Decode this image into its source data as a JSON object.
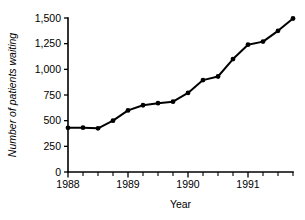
{
  "chart_data": {
    "type": "line",
    "title": "",
    "xlabel": "Year",
    "ylabel": "Number of patients waiting",
    "xlim": [
      1988.0,
      1991.75
    ],
    "ylim": [
      0,
      1500
    ],
    "grid": false,
    "legend": null,
    "marker": "filled-circle",
    "line_color": "#000000",
    "x": [
      1988.0,
      1988.25,
      1988.5,
      1988.75,
      1989.0,
      1989.25,
      1989.5,
      1989.75,
      1990.0,
      1990.25,
      1990.5,
      1990.75,
      1991.0,
      1991.25,
      1991.5,
      1991.75
    ],
    "values": [
      430,
      432,
      425,
      500,
      600,
      650,
      670,
      685,
      770,
      895,
      930,
      1100,
      1240,
      1270,
      1375,
      1495
    ],
    "x_tick_labels": [
      "1988",
      "1989",
      "1990",
      "1991"
    ],
    "x_tick_values": [
      1988,
      1989,
      1990,
      1991
    ],
    "x_minor_tick_values": [
      1988.0,
      1988.25,
      1988.5,
      1988.75,
      1989.0,
      1989.25,
      1989.5,
      1989.75,
      1990.0,
      1990.25,
      1990.5,
      1990.75,
      1991.0,
      1991.25,
      1991.5,
      1991.75
    ],
    "y_tick_labels": [
      "0",
      "250",
      "500",
      "750",
      "1,000",
      "1,250",
      "1,500"
    ],
    "y_tick_values": [
      0,
      250,
      500,
      750,
      1000,
      1250,
      1500
    ]
  }
}
